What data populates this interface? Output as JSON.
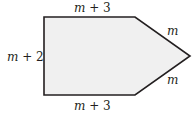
{
  "diagram": {
    "shape": "pentagon",
    "fill_color": "#f0f0f0",
    "stroke_color": "#231f20",
    "vertices": [
      [
        44,
        17
      ],
      [
        135,
        17
      ],
      [
        190,
        56
      ],
      [
        135,
        95
      ],
      [
        44,
        95
      ]
    ],
    "labels": {
      "top": {
        "var": "m",
        "rest": " + 3"
      },
      "left": {
        "var": "m",
        "rest": " + 2"
      },
      "upper_right": {
        "var": "m",
        "rest": ""
      },
      "lower_right": {
        "var": "m",
        "rest": ""
      },
      "bottom": {
        "var": "m",
        "rest": " + 3"
      }
    }
  }
}
